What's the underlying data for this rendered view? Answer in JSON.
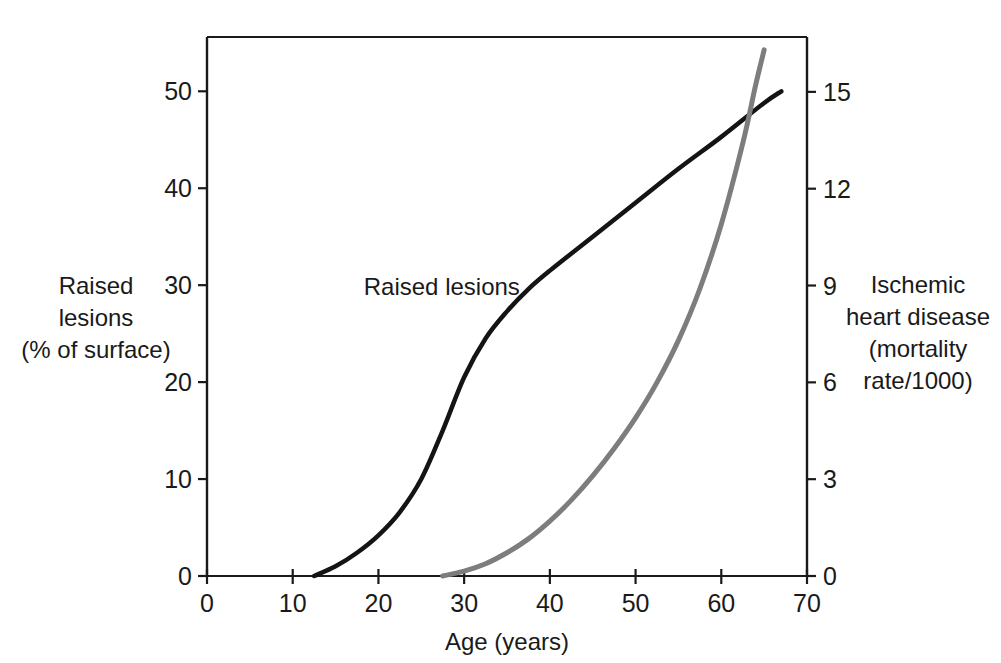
{
  "chart_data": {
    "type": "line",
    "title": "",
    "xlabel": "Age (years)",
    "ylabel": "Raised lesions (% of surface)",
    "y2label": "Ischemic heart disease (mortality rate/1000)",
    "xlim": [
      0,
      70
    ],
    "ylim": [
      0,
      55.6
    ],
    "y2lim": [
      0,
      16.7
    ],
    "grid": false,
    "legend_position": "inline-annotations",
    "xticks": [
      0,
      10,
      20,
      30,
      40,
      50,
      60,
      70
    ],
    "xtick_labels": [
      "0",
      "10",
      "20",
      "30",
      "40",
      "50",
      "60",
      "70"
    ],
    "yticks": [
      0,
      10,
      20,
      30,
      40,
      50
    ],
    "ytick_labels": [
      "0",
      "10",
      "20",
      "30",
      "40",
      "50"
    ],
    "y2ticks": [
      0,
      3,
      6,
      9,
      12,
      15
    ],
    "y2tick_labels": [
      "0",
      "3",
      "6",
      "9",
      "12",
      "15"
    ],
    "series": [
      {
        "name": "Raised lesions",
        "axis": "left",
        "color": "#141414",
        "width": 4.5,
        "x": [
          12.5,
          15,
          17.5,
          20,
          22.5,
          25,
          27.5,
          30,
          32.5,
          35,
          37.5,
          40,
          45,
          50,
          55,
          60,
          65,
          67
        ],
        "values": [
          0,
          1.0,
          2.4,
          4.2,
          6.6,
          10.0,
          15.0,
          20.5,
          24.5,
          27.3,
          29.6,
          31.5,
          35.0,
          38.5,
          42.0,
          45.3,
          48.8,
          50.0
        ]
      },
      {
        "name": "Mortality rate",
        "axis": "right",
        "color": "#7d7d7d",
        "width": 5.0,
        "x": [
          27.5,
          30,
          32.5,
          35,
          37.5,
          40,
          42.5,
          45,
          47.5,
          50,
          52.5,
          55,
          57.5,
          60,
          62.5,
          64,
          65
        ],
        "values": [
          0,
          0.15,
          0.38,
          0.72,
          1.15,
          1.7,
          2.35,
          3.1,
          3.95,
          4.9,
          6.0,
          7.3,
          8.9,
          10.9,
          13.4,
          15.2,
          16.3
        ]
      }
    ],
    "annotations": [
      {
        "text": "Raised lesions",
        "label_x": 36.5,
        "label_y": 29.8,
        "leader_to_x": 40.0,
        "leader_to_y": 31.6
      },
      {
        "text": "Mortality rate",
        "label_x": 46.5,
        "label_y": 19.3,
        "leader_to_x": 54.2,
        "leader_to_y": 21.0
      }
    ]
  },
  "axes": {
    "x_title": "Age (years)",
    "y_left_title_lines": [
      "Raised",
      "lesions",
      "(% of surface)"
    ],
    "y_right_title_lines": [
      "Ischemic",
      "heart disease",
      "(mortality",
      "rate/1000)"
    ]
  },
  "colors": {
    "raised_lesions": "#141414",
    "mortality_rate": "#7d7d7d",
    "axis": "#1a1a1a",
    "background": "#ffffff"
  }
}
